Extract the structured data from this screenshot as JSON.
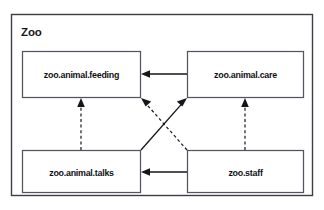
{
  "diagram": {
    "type": "uml-package-diagram",
    "package_title": "Zoo",
    "background_color": "#ffffff",
    "line_color": "#16161a",
    "frame_color": "#3d3d46",
    "node_border_color": "#55555f",
    "nodes": [
      {
        "id": "feeding",
        "label": "zoo.animal.feeding",
        "x": 22,
        "y": 51,
        "width": 119,
        "height": 47
      },
      {
        "id": "care",
        "label": "zoo.animal.care",
        "x": 187,
        "y": 51,
        "width": 117,
        "height": 47
      },
      {
        "id": "talks",
        "label": "zoo.animal.talks",
        "x": 22,
        "y": 150,
        "width": 119,
        "height": 43
      },
      {
        "id": "staff",
        "label": "zoo.staff",
        "x": 187,
        "y": 150,
        "width": 117,
        "height": 43
      }
    ],
    "edges": [
      {
        "id": "care-to-feeding",
        "from": "care",
        "to": "feeding",
        "style": "solid",
        "direction": "left"
      },
      {
        "id": "staff-to-talks",
        "from": "staff",
        "to": "talks",
        "style": "solid",
        "direction": "left"
      },
      {
        "id": "talks-to-care",
        "from": "talks",
        "to": "care",
        "style": "solid",
        "direction": "diagonal-up-right"
      },
      {
        "id": "talks-to-feeding",
        "from": "talks",
        "to": "feeding",
        "style": "dashed",
        "direction": "up"
      },
      {
        "id": "staff-to-care",
        "from": "staff",
        "to": "care",
        "style": "dashed",
        "direction": "up"
      },
      {
        "id": "staff-to-feeding",
        "from": "staff",
        "to": "feeding",
        "style": "dashed",
        "direction": "diagonal-up-left"
      }
    ]
  }
}
